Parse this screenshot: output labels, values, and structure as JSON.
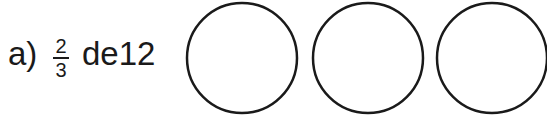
{
  "exercise": {
    "label": "a)",
    "fraction": {
      "numerator": "2",
      "denominator": "3"
    },
    "text": "de12"
  },
  "circles": [
    {
      "cx": 242,
      "cy": 58,
      "r": 55
    },
    {
      "cx": 368,
      "cy": 58,
      "r": 55
    },
    {
      "cx": 492,
      "cy": 58,
      "r": 55
    }
  ],
  "colors": {
    "ink": "#1a1a1a",
    "background": "#ffffff"
  }
}
